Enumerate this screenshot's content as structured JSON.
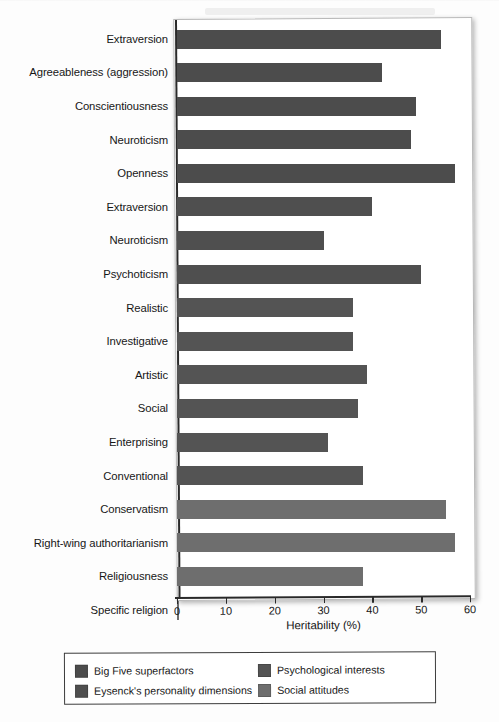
{
  "chart_data": {
    "type": "bar",
    "orientation": "horizontal",
    "title": "",
    "xlabel": "Heritability (%)",
    "ylabel": "",
    "xlim": [
      0,
      60
    ],
    "xticks": [
      0,
      10,
      20,
      30,
      40,
      50,
      60
    ],
    "grid": false,
    "legend_position": "bottom",
    "categories": [
      "Extraversion",
      "Agreeableness (aggression)",
      "Conscientiousness",
      "Neuroticism",
      "Openness",
      "Extraversion",
      "Neuroticism",
      "Psychoticism",
      "Realistic",
      "Investigative",
      "Artistic",
      "Social",
      "Enterprising",
      "Conventional",
      "Conservatism",
      "Right-wing authoritarianism",
      "Religiousness",
      "Specific religion"
    ],
    "values": [
      54,
      42,
      49,
      48,
      57,
      40,
      30,
      50,
      36,
      36,
      39,
      37,
      31,
      38,
      55,
      57,
      38,
      0.5
    ],
    "groups": [
      "Big Five superfactors",
      "Big Five superfactors",
      "Big Five superfactors",
      "Big Five superfactors",
      "Big Five superfactors",
      "Eysenck's personality dimensions",
      "Eysenck's personality dimensions",
      "Eysenck's personality dimensions",
      "Psychological interests",
      "Psychological interests",
      "Psychological interests",
      "Psychological interests",
      "Psychological interests",
      "Psychological interests",
      "Social attitudes",
      "Social attitudes",
      "Social attitudes",
      "Social attitudes"
    ],
    "series": [
      {
        "name": "Big Five superfactors",
        "color": "#4c4c4c",
        "points": [
          {
            "label": "Extraversion",
            "value": 54
          },
          {
            "label": "Agreeableness (aggression)",
            "value": 42
          },
          {
            "label": "Conscientiousness",
            "value": 49
          },
          {
            "label": "Neuroticism",
            "value": 48
          },
          {
            "label": "Openness",
            "value": 57
          }
        ]
      },
      {
        "name": "Eysenck's personality dimensions",
        "color": "#4f4f4f",
        "points": [
          {
            "label": "Extraversion",
            "value": 40
          },
          {
            "label": "Neuroticism",
            "value": 30
          },
          {
            "label": "Psychoticism",
            "value": 50
          }
        ]
      },
      {
        "name": "Psychological interests",
        "color": "#545454",
        "points": [
          {
            "label": "Realistic",
            "value": 36
          },
          {
            "label": "Investigative",
            "value": 36
          },
          {
            "label": "Artistic",
            "value": 39
          },
          {
            "label": "Social",
            "value": 37
          },
          {
            "label": "Enterprising",
            "value": 31
          },
          {
            "label": "Conventional",
            "value": 38
          }
        ]
      },
      {
        "name": "Social attitudes",
        "color": "#6e6e6e",
        "points": [
          {
            "label": "Conservatism",
            "value": 55
          },
          {
            "label": "Right-wing authoritarianism",
            "value": 57
          },
          {
            "label": "Religiousness",
            "value": 38
          },
          {
            "label": "Specific religion",
            "value": 0.5
          }
        ]
      }
    ]
  },
  "rows": [
    {
      "label": "Extraversion",
      "value": 54,
      "group": 1
    },
    {
      "label": "Agreeableness (aggression)",
      "value": 42,
      "group": 1
    },
    {
      "label": "Conscientiousness",
      "value": 49,
      "group": 1
    },
    {
      "label": "Neuroticism",
      "value": 48,
      "group": 1
    },
    {
      "label": "Openness",
      "value": 57,
      "group": 1
    },
    {
      "label": "Extraversion",
      "value": 40,
      "group": 2
    },
    {
      "label": "Neuroticism",
      "value": 30,
      "group": 2
    },
    {
      "label": "Psychoticism",
      "value": 50,
      "group": 2
    },
    {
      "label": "Realistic",
      "value": 36,
      "group": 3
    },
    {
      "label": "Investigative",
      "value": 36,
      "group": 3
    },
    {
      "label": "Artistic",
      "value": 39,
      "group": 3
    },
    {
      "label": "Social",
      "value": 37,
      "group": 3
    },
    {
      "label": "Enterprising",
      "value": 31,
      "group": 3
    },
    {
      "label": "Conventional",
      "value": 38,
      "group": 3
    },
    {
      "label": "Conservatism",
      "value": 55,
      "group": 4
    },
    {
      "label": "Right-wing authoritarianism",
      "value": 57,
      "group": 4
    },
    {
      "label": "Religiousness",
      "value": 38,
      "group": 4
    },
    {
      "label": "Specific religion",
      "value": 0.5,
      "group": 4
    }
  ],
  "xaxis": {
    "ticks": [
      "0",
      "10",
      "20",
      "30",
      "40",
      "50",
      "60"
    ],
    "label": "Heritability (%)"
  },
  "legend": {
    "items": [
      {
        "label": "Big Five superfactors",
        "color": "#4c4c4c"
      },
      {
        "label": "Psychological interests",
        "color": "#545454"
      },
      {
        "label": "Eysenck's personality dimensions",
        "color": "#4f4f4f"
      },
      {
        "label": "Social attitudes",
        "color": "#6e6e6e"
      }
    ]
  }
}
